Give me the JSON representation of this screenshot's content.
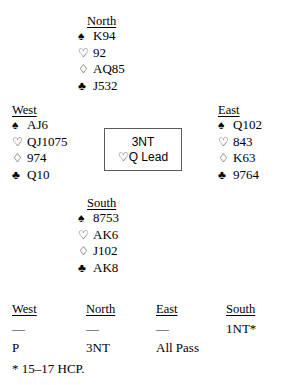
{
  "suits": {
    "spade": "♠",
    "heart": "♡",
    "diamond": "♢",
    "club": "♣"
  },
  "hands": {
    "north": {
      "label": "North",
      "spades": "K94",
      "hearts": "92",
      "diamonds": "AQ85",
      "clubs": "J532"
    },
    "west": {
      "label": "West",
      "spades": "AJ6",
      "hearts": "QJ1075",
      "diamonds": "974",
      "clubs": "Q10"
    },
    "east": {
      "label": "East",
      "spades": "Q102",
      "hearts": "843",
      "diamonds": "K63",
      "clubs": "9764"
    },
    "south": {
      "label": "South",
      "spades": "8753",
      "hearts": "AK6",
      "diamonds": "J102",
      "clubs": "AK8"
    }
  },
  "contract_box": {
    "contract": "3NT",
    "lead": "♡Q Lead"
  },
  "auction": {
    "headers": [
      "West",
      "North",
      "East",
      "South"
    ],
    "rows": [
      [
        "—",
        "—",
        "—",
        "1NT*"
      ],
      [
        "P",
        "3NT",
        "All Pass",
        ""
      ]
    ]
  },
  "footnote": "* 15–17 HCP."
}
